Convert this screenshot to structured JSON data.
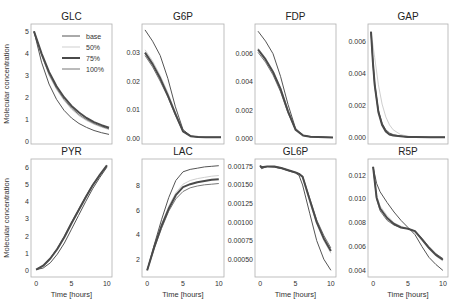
{
  "figure": {
    "ylabel": "Molecular concentration",
    "xlabel": "Time [hours]"
  },
  "legend": {
    "entries": [
      {
        "label": "base",
        "color": "#555555",
        "width": 1.0
      },
      {
        "label": "50%",
        "color": "#cfcfcf",
        "width": 1.0
      },
      {
        "label": "75%",
        "color": "#4a4a4a",
        "width": 2.0
      },
      {
        "label": "100%",
        "color": "#777777",
        "width": 1.0
      }
    ]
  },
  "chart_data": [
    {
      "type": "line",
      "title": "GLC",
      "xlabel": "",
      "ylabel": "Molecular concentration",
      "xlim": [
        0,
        10
      ],
      "ylim": [
        0,
        5.2
      ],
      "yticks": [
        0,
        1,
        2,
        3,
        4,
        5
      ],
      "ytick_labels": [
        "0",
        "1",
        "2",
        "3",
        "4",
        "5"
      ],
      "xticks": [],
      "x": [
        0,
        1,
        2,
        3,
        4,
        5,
        6,
        7,
        8,
        9,
        10
      ],
      "series": [
        {
          "name": "base",
          "values": [
            5.0,
            3.6,
            2.6,
            1.9,
            1.4,
            1.05,
            0.8,
            0.62,
            0.48,
            0.38,
            0.3
          ]
        },
        {
          "name": "50%",
          "values": [
            5.0,
            3.9,
            3.0,
            2.35,
            1.85,
            1.45,
            1.15,
            0.93,
            0.76,
            0.63,
            0.52
          ]
        },
        {
          "name": "75%",
          "values": [
            5.0,
            4.0,
            3.15,
            2.5,
            2.0,
            1.6,
            1.3,
            1.05,
            0.86,
            0.72,
            0.6
          ]
        },
        {
          "name": "100%",
          "values": [
            5.0,
            3.95,
            3.05,
            2.4,
            1.9,
            1.5,
            1.2,
            0.97,
            0.8,
            0.66,
            0.55
          ]
        }
      ]
    },
    {
      "type": "line",
      "title": "G6P",
      "xlabel": "",
      "ylabel": "",
      "xlim": [
        0,
        10
      ],
      "ylim": [
        -0.001,
        0.039
      ],
      "yticks": [
        0.0,
        0.01,
        0.02,
        0.03
      ],
      "ytick_labels": [
        "0.00",
        "0.01",
        "0.02",
        "0.03"
      ],
      "xticks": [],
      "x": [
        0,
        1,
        2,
        3,
        4,
        5,
        6,
        7,
        8,
        9,
        10
      ],
      "series": [
        {
          "name": "base",
          "values": [
            0.038,
            0.034,
            0.029,
            0.021,
            0.011,
            0.003,
            0.0008,
            0.0004,
            0.0003,
            0.0003,
            0.0003
          ]
        },
        {
          "name": "50%",
          "values": [
            0.031,
            0.027,
            0.022,
            0.016,
            0.009,
            0.0025,
            0.0007,
            0.0004,
            0.0003,
            0.0003,
            0.0003
          ]
        },
        {
          "name": "75%",
          "values": [
            0.03,
            0.026,
            0.021,
            0.015,
            0.0085,
            0.0024,
            0.0007,
            0.0004,
            0.0003,
            0.0003,
            0.0003
          ]
        },
        {
          "name": "100%",
          "values": [
            0.029,
            0.025,
            0.02,
            0.0145,
            0.008,
            0.0023,
            0.0007,
            0.0004,
            0.0003,
            0.0003,
            0.0003
          ]
        }
      ]
    },
    {
      "type": "line",
      "title": "FDP",
      "xlabel": "",
      "ylabel": "",
      "xlim": [
        0,
        10
      ],
      "ylim": [
        -0.0002,
        0.0079
      ],
      "yticks": [
        0.0,
        0.002,
        0.004,
        0.006
      ],
      "ytick_labels": [
        "0.000",
        "0.002",
        "0.004",
        "0.006"
      ],
      "xticks": [],
      "x": [
        0,
        1,
        2,
        3,
        4,
        5,
        6,
        7,
        8,
        9,
        10
      ],
      "series": [
        {
          "name": "base",
          "values": [
            0.0076,
            0.0069,
            0.006,
            0.0044,
            0.0024,
            0.0007,
            0.0002,
            0.0001,
            8e-05,
            6e-05,
            5e-05
          ]
        },
        {
          "name": "50%",
          "values": [
            0.0064,
            0.0057,
            0.0048,
            0.0036,
            0.002,
            0.0006,
            0.0002,
            0.0001,
            8e-05,
            6e-05,
            5e-05
          ]
        },
        {
          "name": "75%",
          "values": [
            0.0063,
            0.0056,
            0.0047,
            0.0035,
            0.0019,
            0.0006,
            0.0002,
            0.0001,
            8e-05,
            6e-05,
            5e-05
          ]
        },
        {
          "name": "100%",
          "values": [
            0.0061,
            0.0054,
            0.0045,
            0.0033,
            0.0018,
            0.0006,
            0.0002,
            0.0001,
            8e-05,
            6e-05,
            5e-05
          ]
        }
      ]
    },
    {
      "type": "line",
      "title": "GAP",
      "xlabel": "",
      "ylabel": "",
      "xlim": [
        0,
        10
      ],
      "ylim": [
        -0.0002,
        0.0069
      ],
      "yticks": [
        0.0,
        0.002,
        0.004,
        0.006
      ],
      "ytick_labels": [
        "0.000",
        "0.002",
        "0.004",
        "0.006"
      ],
      "xticks": [],
      "x": [
        0,
        0.25,
        0.5,
        1,
        1.5,
        2,
        2.5,
        3,
        4,
        5,
        6,
        8,
        10
      ],
      "series": [
        {
          "name": "base",
          "values": [
            0.0066,
            0.0048,
            0.0034,
            0.0017,
            0.0009,
            0.0005,
            0.0003,
            0.0002,
            0.0001,
            5e-05,
            4e-05,
            3e-05,
            3e-05
          ]
        },
        {
          "name": "50%",
          "values": [
            0.0066,
            0.0058,
            0.005,
            0.0033,
            0.0021,
            0.0013,
            0.0008,
            0.0005,
            0.0002,
            0.0001,
            5e-05,
            3e-05,
            3e-05
          ]
        },
        {
          "name": "75%",
          "values": [
            0.0066,
            0.0047,
            0.0033,
            0.0016,
            0.0008,
            0.0004,
            0.0002,
            0.00015,
            0.0001,
            5e-05,
            4e-05,
            3e-05,
            3e-05
          ]
        },
        {
          "name": "100%",
          "values": [
            0.0066,
            0.0046,
            0.0032,
            0.0016,
            0.0008,
            0.0004,
            0.0002,
            0.00015,
            0.0001,
            5e-05,
            4e-05,
            3e-05,
            3e-05
          ]
        }
      ]
    },
    {
      "type": "line",
      "title": "PYR",
      "xlabel": "Time [hours]",
      "ylabel": "Molecular concentration",
      "xlim": [
        -0.3,
        10.3
      ],
      "ylim": [
        -0.2,
        6.3
      ],
      "yticks": [
        0,
        1,
        2,
        3,
        4,
        5,
        6
      ],
      "ytick_labels": [
        "0",
        "1",
        "2",
        "3",
        "4",
        "5",
        "6"
      ],
      "xticks": [
        0,
        5,
        10
      ],
      "xtick_labels": [
        "0",
        "5",
        "10"
      ],
      "x": [
        0,
        1,
        2,
        3,
        4,
        5,
        6,
        7,
        8,
        9,
        10
      ],
      "series": [
        {
          "name": "base",
          "values": [
            0.05,
            0.15,
            0.45,
            0.95,
            1.6,
            2.4,
            3.2,
            4.0,
            4.75,
            5.4,
            6.0
          ]
        },
        {
          "name": "50%",
          "values": [
            0.05,
            0.25,
            0.65,
            1.2,
            1.9,
            2.7,
            3.45,
            4.2,
            4.9,
            5.5,
            6.05
          ]
        },
        {
          "name": "75%",
          "values": [
            0.05,
            0.28,
            0.7,
            1.25,
            1.95,
            2.75,
            3.5,
            4.25,
            4.95,
            5.55,
            6.1
          ]
        },
        {
          "name": "100%",
          "values": [
            0.05,
            0.3,
            0.72,
            1.3,
            2.0,
            2.8,
            3.55,
            4.3,
            5.0,
            5.55,
            6.1
          ]
        }
      ]
    },
    {
      "type": "line",
      "title": "LAC",
      "xlabel": "Time [hours]",
      "ylabel": "",
      "xlim": [
        -0.3,
        10.3
      ],
      "ylim": [
        0.8,
        9.9
      ],
      "yticks": [
        2,
        4,
        6,
        8
      ],
      "ytick_labels": [
        "2",
        "4",
        "6",
        "8"
      ],
      "xticks": [
        0,
        5,
        10
      ],
      "xtick_labels": [
        "0",
        "5",
        "10"
      ],
      "x": [
        0,
        1,
        2,
        3,
        4,
        5,
        6,
        7,
        8,
        9,
        10
      ],
      "series": [
        {
          "name": "base",
          "values": [
            1.1,
            3.2,
            5.2,
            7.0,
            8.4,
            9.1,
            9.3,
            9.4,
            9.5,
            9.55,
            9.6
          ]
        },
        {
          "name": "50%",
          "values": [
            1.1,
            3.0,
            4.8,
            6.3,
            7.4,
            8.1,
            8.4,
            8.55,
            8.65,
            8.75,
            8.8
          ]
        },
        {
          "name": "75%",
          "values": [
            1.1,
            3.0,
            4.7,
            6.1,
            7.2,
            7.85,
            8.1,
            8.25,
            8.35,
            8.45,
            8.5
          ]
        },
        {
          "name": "100%",
          "values": [
            1.1,
            2.9,
            4.5,
            5.9,
            6.9,
            7.5,
            7.8,
            7.95,
            8.05,
            8.1,
            8.15
          ]
        }
      ]
    },
    {
      "type": "line",
      "title": "GL6P",
      "xlabel": "Time [hours]",
      "ylabel": "",
      "xlim": [
        -0.3,
        10.3
      ],
      "ylim": [
        0.0003,
        0.00181
      ],
      "yticks": [
        0.0005,
        0.00075,
        0.001,
        0.00125,
        0.0015,
        0.00175
      ],
      "ytick_labels": [
        "0.00050",
        "0.00075",
        "0.00100",
        "0.00125",
        "0.00150",
        "0.00175"
      ],
      "xticks": [
        0,
        5,
        10
      ],
      "xtick_labels": [
        "0",
        "5",
        "10"
      ],
      "x": [
        0,
        0.2,
        1,
        2,
        3,
        4,
        5,
        5.5,
        6,
        7,
        8,
        9,
        10
      ],
      "series": [
        {
          "name": "base",
          "values": [
            0.00176,
            0.00172,
            0.00175,
            0.00174,
            0.00172,
            0.00169,
            0.00166,
            0.00163,
            0.0015,
            0.00112,
            0.00075,
            0.0005,
            0.00035
          ]
        },
        {
          "name": "50%",
          "values": [
            0.00176,
            0.00173,
            0.00175,
            0.00175,
            0.00173,
            0.0017,
            0.00167,
            0.00165,
            0.0016,
            0.00128,
            0.00098,
            0.00075,
            0.00058
          ]
        },
        {
          "name": "75%",
          "values": [
            0.00176,
            0.00174,
            0.00175,
            0.00175,
            0.00173,
            0.0017,
            0.00167,
            0.00165,
            0.00161,
            0.0013,
            0.001,
            0.00078,
            0.00061
          ]
        },
        {
          "name": "100%",
          "values": [
            0.00176,
            0.00175,
            0.00175,
            0.00175,
            0.00173,
            0.0017,
            0.00167,
            0.00165,
            0.00162,
            0.00132,
            0.00103,
            0.00082,
            0.00065
          ]
        }
      ]
    },
    {
      "type": "line",
      "title": "R5P",
      "xlabel": "Time [hours]",
      "ylabel": "",
      "xlim": [
        -0.3,
        10.3
      ],
      "ylim": [
        0.0037,
        0.0131
      ],
      "yticks": [
        0.004,
        0.006,
        0.008,
        0.01,
        0.012
      ],
      "ytick_labels": [
        "0.004",
        "0.006",
        "0.008",
        "0.010",
        "0.012"
      ],
      "xticks": [
        0,
        5,
        10
      ],
      "xtick_labels": [
        "0",
        "5",
        "10"
      ],
      "x": [
        0,
        0.5,
        1,
        2,
        3,
        4,
        5,
        6,
        7,
        8,
        9,
        10
      ],
      "series": [
        {
          "name": "base",
          "values": [
            0.0127,
            0.0113,
            0.0106,
            0.0097,
            0.0089,
            0.0082,
            0.0076,
            0.007,
            0.006,
            0.0051,
            0.0045,
            0.004
          ]
        },
        {
          "name": "50%",
          "values": [
            0.0127,
            0.0103,
            0.0094,
            0.0086,
            0.008,
            0.0077,
            0.0075,
            0.0072,
            0.0065,
            0.0058,
            0.0052,
            0.0048
          ]
        },
        {
          "name": "75%",
          "values": [
            0.0127,
            0.0101,
            0.0092,
            0.0084,
            0.0079,
            0.0076,
            0.0075,
            0.0073,
            0.0066,
            0.0059,
            0.0053,
            0.0049
          ]
        },
        {
          "name": "100%",
          "values": [
            0.0127,
            0.01,
            0.009,
            0.0082,
            0.0078,
            0.0076,
            0.0075,
            0.0073,
            0.0067,
            0.006,
            0.0054,
            0.005
          ]
        }
      ]
    }
  ]
}
